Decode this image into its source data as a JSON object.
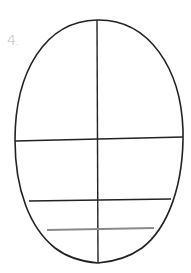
{
  "diagram": {
    "step_label": "4.",
    "colors": {
      "outline": "#222222",
      "guide_line": "#222222",
      "highlight_guide": "#8a8a8a",
      "label": "#b8b8b8",
      "background": "#ffffff"
    },
    "guides": [
      {
        "name": "vertical-center",
        "orientation": "vertical"
      },
      {
        "name": "eye-line",
        "orientation": "horizontal"
      },
      {
        "name": "nose-line",
        "orientation": "horizontal"
      },
      {
        "name": "mouth-line",
        "orientation": "horizontal",
        "highlighted": true
      }
    ]
  }
}
